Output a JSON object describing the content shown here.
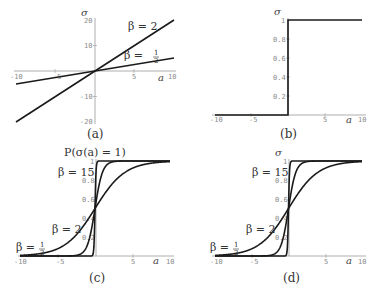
{
  "chart_data": [
    {
      "panel": "a",
      "type": "line",
      "caption": "(a)",
      "ylabel": "σ",
      "xlabel": "a",
      "xlim": [
        -10,
        10
      ],
      "ylim": [
        -20,
        20
      ],
      "xticks": [
        "-10",
        "-5",
        "5",
        "10"
      ],
      "yticks": [
        "20",
        "10",
        "-10",
        "-20"
      ],
      "series": [
        {
          "name": "β = 2",
          "x": [
            -10,
            10
          ],
          "values": [
            -20,
            20
          ]
        },
        {
          "name": "β = 1/2",
          "x": [
            -10,
            10
          ],
          "values": [
            -5,
            5
          ]
        }
      ],
      "annotations": [
        "β = 2",
        "β = ½"
      ]
    },
    {
      "panel": "b",
      "type": "line",
      "caption": "(b)",
      "ylabel": "σ",
      "xlabel": "a",
      "xlim": [
        -10,
        10
      ],
      "ylim": [
        0,
        1
      ],
      "xticks": [
        "-10",
        "-5",
        "5",
        "10"
      ],
      "yticks": [
        "1",
        "0.8",
        "0.6",
        "0.4",
        "0.2"
      ],
      "series": [
        {
          "name": "step",
          "x": [
            -10,
            0,
            0,
            10
          ],
          "values": [
            0,
            0,
            1,
            1
          ]
        }
      ]
    },
    {
      "panel": "c",
      "type": "line",
      "caption": "(c)",
      "title": "P(σ(a) = 1)",
      "xlabel": "a",
      "xlim": [
        -10,
        10
      ],
      "ylim": [
        0,
        1
      ],
      "xticks": [
        "-10",
        "-5",
        "5",
        "10"
      ],
      "yticks": [
        "1",
        "0.8",
        "0.6",
        "0.4",
        "0.2"
      ],
      "series": [
        {
          "name": "β = 1/2",
          "function": "1/(1+exp(-a/2))"
        },
        {
          "name": "β = 2",
          "function": "1/(1+exp(-2a))"
        },
        {
          "name": "β = 15",
          "function": "1/(1+exp(-15a))"
        }
      ],
      "annotations": [
        "β = 15",
        "β = 2",
        "β = ½"
      ]
    },
    {
      "panel": "d",
      "type": "line",
      "caption": "(d)",
      "ylabel": "σ",
      "xlabel": "a",
      "xlim": [
        -10,
        10
      ],
      "ylim": [
        0,
        1
      ],
      "xticks": [
        "-10",
        "-5",
        "5",
        "10"
      ],
      "yticks": [
        "1",
        "0.8",
        "0.6",
        "0.4",
        "0.2"
      ],
      "series": [
        {
          "name": "β = 1/2",
          "function": "1/(1+exp(-a/2))"
        },
        {
          "name": "β = 2",
          "function": "1/(1+exp(-2a))"
        },
        {
          "name": "β = 15",
          "function": "1/(1+exp(-15a))"
        }
      ],
      "annotations": [
        "β = 15",
        "β = 2",
        "β = ½"
      ]
    }
  ],
  "labels": {
    "sigma": "σ",
    "a": "a",
    "beta2": "β = 2",
    "beta15": "β = 15",
    "beta_half_prefix": "β = ",
    "half_num": "1",
    "half_den": "2",
    "cap_a": "(a)",
    "cap_b": "(b)",
    "cap_c": "(c)",
    "cap_d": "(d)",
    "title_c": "P(σ(a) = 1)",
    "t_m10": "-10",
    "t_m5": "-5",
    "t_5": "5",
    "t_10": "10",
    "t_20": "20",
    "t_m20": "-20",
    "t_m10y": "-10",
    "t_1": "1",
    "t_08": "0.8",
    "t_06": "0.6",
    "t_04": "0.4",
    "t_02": "0.2"
  }
}
